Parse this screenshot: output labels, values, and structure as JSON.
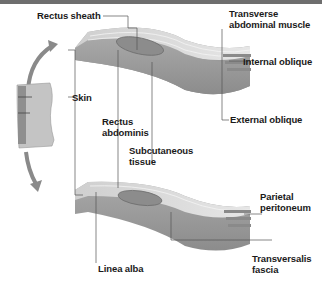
{
  "labels": {
    "rectus_sheath": "Rectus sheath",
    "transverse_line1": "Transverse",
    "transverse_line2": "abdominal muscle",
    "internal_oblique": "Internal oblique",
    "external_oblique": "External oblique",
    "skin": "Skin",
    "rectus_line1": "Rectus",
    "rectus_line2": "abdominis",
    "subcut_line1": "Subcutaneous",
    "subcut_line2": "tissue",
    "parietal_line1": "Parietal",
    "parietal_line2": "peritoneum",
    "linea_alba": "Linea alba",
    "transversalis_line1": "Transversalis",
    "transversalis_line2": "fascia"
  },
  "icons": {
    "torso": "torso-outline-icon",
    "arrow": "curved-arrow-icon"
  },
  "colors": {
    "top_bar": "#6e6e6e",
    "slab_top": "#d9d9d9",
    "slab_side": "#9a9a9a",
    "muscle": "#8a8a8a",
    "leader": "#555555",
    "label_text": "#1a1a1a"
  }
}
